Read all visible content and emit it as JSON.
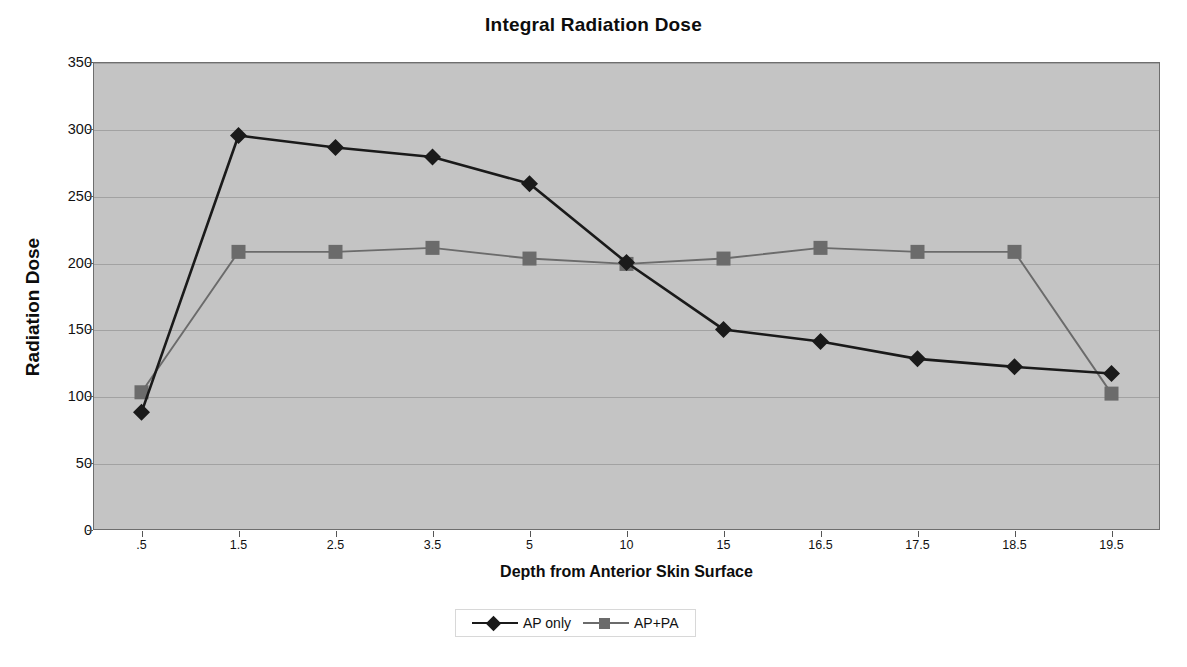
{
  "chart_data": {
    "type": "line",
    "title": "Integral Radiation Dose",
    "xlabel": "Depth from Anterior Skin Surface",
    "ylabel": "Radiation Dose",
    "categories": [
      ".5",
      "1.5",
      "2.5",
      "3.5",
      "5",
      "10",
      "15",
      "16.5",
      "17.5",
      "18.5",
      "19.5"
    ],
    "ylim": [
      0,
      350
    ],
    "yticks": [
      0,
      50,
      100,
      150,
      200,
      250,
      300,
      350
    ],
    "ytick_labels": [
      "0",
      "50",
      "100",
      "150",
      "200",
      "250",
      "300",
      "350"
    ],
    "grid": true,
    "legend_position": "bottom",
    "series": [
      {
        "name": "AP only",
        "marker": "diamond",
        "color": "#1a1a1a",
        "values": [
          88,
          295,
          286,
          279,
          259,
          200,
          150,
          141,
          128,
          122,
          117
        ]
      },
      {
        "name": "AP+PA",
        "marker": "square",
        "color": "#6b6b6b",
        "values": [
          103,
          208,
          208,
          211,
          203,
          199,
          203,
          211,
          208,
          208,
          102
        ]
      }
    ]
  },
  "legend": {
    "entries": [
      {
        "label": "AP only"
      },
      {
        "label": "AP+PA"
      }
    ]
  },
  "colors": {
    "plot_background": "#c4c4c4",
    "gridline": "#a2a2a2",
    "plot_border": "#6e6e6e",
    "series_ap_only": "#1a1a1a",
    "series_ap_pa": "#6b6b6b",
    "page_background": "#ffffff"
  }
}
